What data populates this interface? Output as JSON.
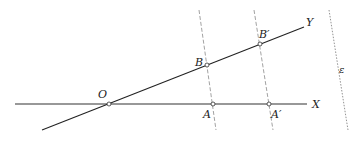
{
  "diagram": {
    "type": "geometry-construction",
    "colors": {
      "line": "#222222",
      "dashed": "#888888",
      "point_fill": "#ffffff"
    },
    "labels": {
      "origin": "O",
      "x_axis": "X",
      "y_axis": "Y",
      "point_A": "A",
      "point_A_prime": "A′",
      "point_B": "B",
      "point_B_prime": "B′",
      "direction_line": "ε"
    },
    "points": [
      {
        "id": "O",
        "x": 109,
        "y": 104
      },
      {
        "id": "A",
        "x": 213,
        "y": 104
      },
      {
        "id": "A'",
        "x": 269,
        "y": 104
      },
      {
        "id": "B",
        "x": 207,
        "y": 65
      },
      {
        "id": "B'",
        "x": 260,
        "y": 44
      }
    ],
    "lines": [
      {
        "id": "OX",
        "style": "solid",
        "from": [
          15,
          104
        ],
        "to": [
          307,
          104
        ]
      },
      {
        "id": "OY",
        "style": "solid",
        "from": [
          42,
          130
        ],
        "to": [
          304,
          27
        ]
      },
      {
        "id": "BA",
        "style": "dashed",
        "from": [
          199,
          10
        ],
        "to": [
          216,
          130
        ]
      },
      {
        "id": "B'A'",
        "style": "dashed",
        "from": [
          254,
          10
        ],
        "to": [
          273,
          130
        ]
      },
      {
        "id": "epsilon",
        "style": "dotted",
        "from": [
          329,
          10
        ],
        "to": [
          348,
          130
        ]
      }
    ]
  }
}
